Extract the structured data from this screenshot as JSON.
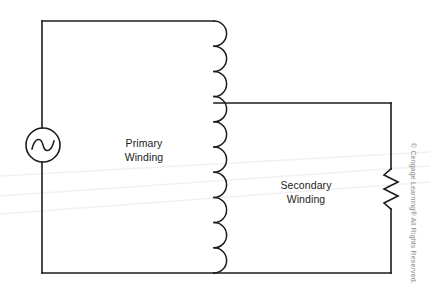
{
  "figure": {
    "type": "circuit-schematic",
    "background_color": "#ffffff",
    "wire_color": "#1c1c1c",
    "label_color": "#1c1c1c",
    "artifact_color": "#f0f0f0"
  },
  "labels": {
    "primary": "Primary\nWinding",
    "primary_line1": "Primary",
    "primary_line2": "Winding",
    "secondary_line1": "Secondary",
    "secondary_line2": "Winding"
  },
  "components": {
    "ac_source": {
      "name": "ac-voltage-source",
      "symbol": "circle-with-sine",
      "cx": 43,
      "cy": 145,
      "r": 17
    },
    "primary_winding": {
      "name": "primary-coil",
      "symbol": "coil-arcs",
      "x": 214,
      "y_top": 21,
      "y_bottom": 273,
      "arcs": 10,
      "bulge": 15
    },
    "secondary_winding": {
      "name": "secondary-coil",
      "note": "shares the same drawn coil column; secondary loop taps at y=103"
    },
    "resistor": {
      "name": "load-resistor",
      "symbol": "zigzag",
      "x": 391,
      "y_top": 169,
      "y_bottom": 209,
      "amplitude": 7,
      "segments": 6
    }
  },
  "wires": {
    "primary_loop": [
      {
        "from": [
          42,
          128
        ],
        "to": [
          42,
          21
        ]
      },
      {
        "from": [
          42,
          21
        ],
        "to": [
          214,
          21
        ]
      },
      {
        "from": [
          42,
          162
        ],
        "to": [
          42,
          273
        ]
      },
      {
        "from": [
          42,
          273
        ],
        "to": [
          214,
          273
        ]
      }
    ],
    "secondary_loop": [
      {
        "from": [
          214,
          103
        ],
        "to": [
          391,
          103
        ]
      },
      {
        "from": [
          391,
          103
        ],
        "to": [
          391,
          169
        ]
      },
      {
        "from": [
          391,
          209
        ],
        "to": [
          391,
          273
        ]
      },
      {
        "from": [
          391,
          273
        ],
        "to": [
          214,
          273
        ]
      }
    ]
  },
  "copyright": {
    "text": "© Cengage Learning® All Rights Reserved."
  }
}
